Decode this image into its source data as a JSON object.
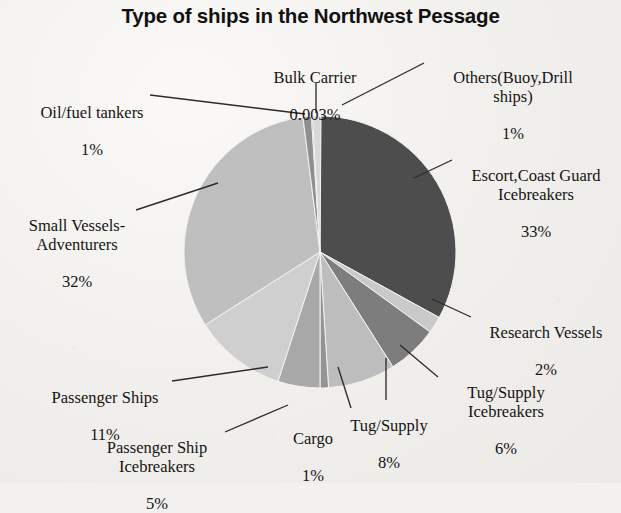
{
  "chart_data": {
    "type": "pie",
    "title": "Type of ships in the Northwest Pessage",
    "xlabel": "",
    "ylabel": "",
    "legend": "none",
    "grid": false,
    "categories": [
      "Escort,Coast Guard Icebreakers",
      "Research Vessels",
      "Tug/Supply Icebreakers",
      "Tug/Supply",
      "Cargo",
      "Passenger Ship Icebreakers",
      "Passenger Ships",
      "Small Vessels-Adventurers",
      "Oil/fuel tankers",
      "Bulk Carrier",
      "Others(Buoy,Drill ships)"
    ],
    "values": [
      33,
      2,
      6,
      8,
      1,
      5,
      11,
      32,
      1,
      0.003,
      1
    ],
    "value_labels": [
      "33%",
      "2%",
      "6%",
      "8%",
      "1%",
      "5%",
      "11%",
      "32%",
      "1%",
      "0.003%",
      "1%"
    ],
    "colors": [
      "#4d4d4d",
      "#c9c9c9",
      "#7d7d7d",
      "#bdbdbd",
      "#949494",
      "#a8a8a8",
      "#cfcfcf",
      "#bfbfbf",
      "#8f8f8f",
      "#0d0d0d",
      "#d8d8d8"
    ],
    "start_angle_deg": 0,
    "direction": "clockwise"
  },
  "title": {
    "text": "Type of ships in the Northwest Pessage"
  },
  "labels": {
    "bulk_carrier": {
      "name": "Bulk Carrier",
      "value": "0.003%"
    },
    "others": {
      "name": "Others(Buoy,Drill\nships)",
      "value": "1%"
    },
    "oil_fuel_tankers": {
      "name": "Oil/fuel tankers",
      "value": "1%"
    },
    "escort": {
      "name": "Escort,Coast Guard\nIcebreakers",
      "value": "33%"
    },
    "small_vessels": {
      "name": "Small Vessels-\nAdventurers",
      "value": "32%"
    },
    "research_vessels": {
      "name": "Research Vessels",
      "value": "2%"
    },
    "tug_supply_ice": {
      "name": "Tug/Supply\nIcebreakers",
      "value": "6%"
    },
    "tug_supply": {
      "name": "Tug/Supply",
      "value": "8%"
    },
    "cargo": {
      "name": "Cargo",
      "value": "1%"
    },
    "passenger_ships": {
      "name": "Passenger Ships",
      "value": "11%"
    },
    "passenger_ship_ice": {
      "name": "Passenger Ship\nIcebreakers",
      "value": "5%"
    }
  }
}
